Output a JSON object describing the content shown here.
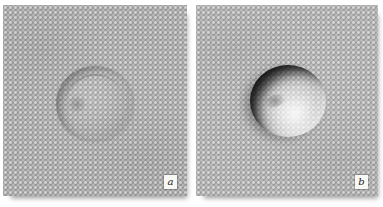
{
  "figure": {
    "type": "micrograph-pair",
    "panels": [
      {
        "label": "a"
      },
      {
        "label": "b"
      }
    ],
    "colors": {
      "page_background": "#ffffff",
      "micrograph_gray_a": "#9a9a9a",
      "micrograph_gray_b": "#a1a1a1",
      "texture_dot_light": "#c9c9c9",
      "vesicle_shadow_dark": "#1c1c1c",
      "vesicle_highlight": "#eeeeee",
      "label_box_background": "#f7f7f4"
    }
  }
}
